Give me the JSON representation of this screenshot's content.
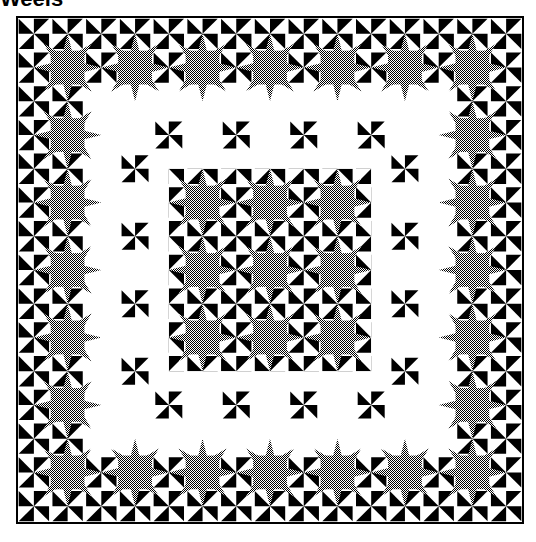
{
  "title": "Weels",
  "colors": {
    "background": "#ffffff",
    "frame": "#000000",
    "star": "#808080",
    "pinwheel": "#000000"
  },
  "quilt": {
    "origin": 17,
    "size": 506,
    "cells": 15,
    "border_stars": [
      [
        1.5,
        1.5
      ],
      [
        3.5,
        1.5
      ],
      [
        5.5,
        1.5
      ],
      [
        7.5,
        1.5
      ],
      [
        9.5,
        1.5
      ],
      [
        11.5,
        1.5
      ],
      [
        13.5,
        1.5
      ],
      [
        1.5,
        13.5
      ],
      [
        3.5,
        13.5
      ],
      [
        5.5,
        13.5
      ],
      [
        7.5,
        13.5
      ],
      [
        9.5,
        13.5
      ],
      [
        11.5,
        13.5
      ],
      [
        13.5,
        13.5
      ],
      [
        1.5,
        3.5
      ],
      [
        1.5,
        5.5
      ],
      [
        1.5,
        7.5
      ],
      [
        1.5,
        9.5
      ],
      [
        1.5,
        11.5
      ],
      [
        13.5,
        3.5
      ],
      [
        13.5,
        5.5
      ],
      [
        13.5,
        7.5
      ],
      [
        13.5,
        9.5
      ],
      [
        13.5,
        11.5
      ]
    ],
    "inner_stars": [
      [
        5.5,
        5.5
      ],
      [
        7.5,
        5.5
      ],
      [
        9.5,
        5.5
      ],
      [
        5.5,
        7.5
      ],
      [
        7.5,
        7.5
      ],
      [
        9.5,
        7.5
      ],
      [
        5.5,
        9.5
      ],
      [
        7.5,
        9.5
      ],
      [
        9.5,
        9.5
      ]
    ],
    "white_gap": {
      "outer": [
        2,
        13
      ],
      "inner": [
        4.5,
        10.5
      ]
    }
  }
}
